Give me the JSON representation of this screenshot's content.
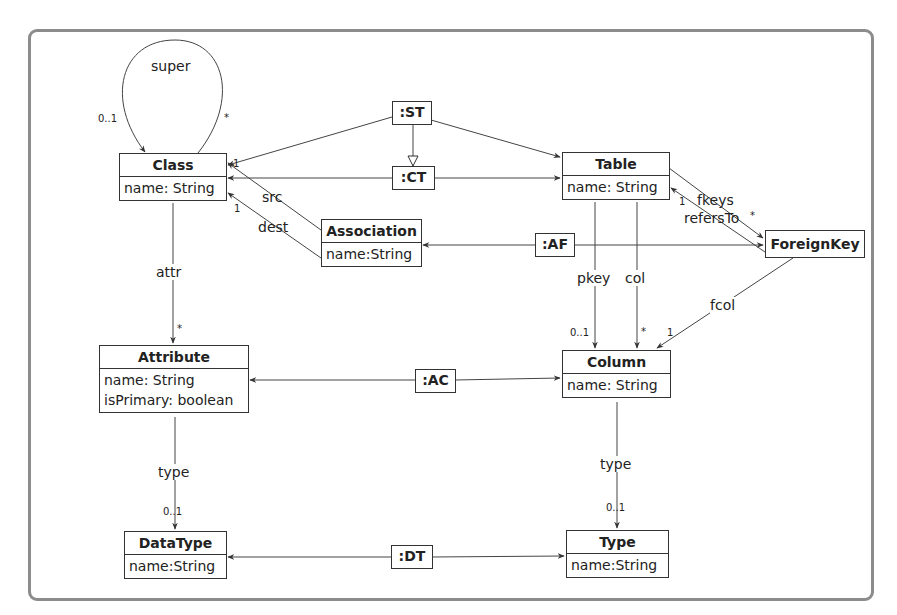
{
  "classes": {
    "class": {
      "name": "Class",
      "attributes": [
        "name: String"
      ]
    },
    "table": {
      "name": "Table",
      "attributes": [
        "name: String"
      ]
    },
    "association": {
      "name": "Association",
      "attributes": [
        "name:String"
      ]
    },
    "foreignkey": {
      "name": "ForeignKey",
      "attributes": []
    },
    "attribute": {
      "name": "Attribute",
      "attributes": [
        "name: String",
        "isPrimary: boolean"
      ]
    },
    "column": {
      "name": "Column",
      "attributes": [
        "name: String"
      ]
    },
    "datatype": {
      "name": "DataType",
      "attributes": [
        "name:String"
      ]
    },
    "type": {
      "name": "Type",
      "attributes": [
        "name:String"
      ]
    }
  },
  "mapping_nodes": {
    "st": ":ST",
    "ct": ":CT",
    "af": ":AF",
    "ac": ":AC",
    "dt": ":DT"
  },
  "edge_labels": {
    "super": "super",
    "super_mult_src": "0..1",
    "super_mult_tgt": "*",
    "src": "src",
    "src_mult": "1",
    "dest": "dest",
    "dest_mult": "1",
    "attr": "attr",
    "attr_mult": "*",
    "attr_type": "type",
    "attr_type_mult": "0..1",
    "fkeys": "fkeys",
    "fkeys_mult": "*",
    "refersTo": "refersTo",
    "refersTo_mult": "1",
    "pkey": "pkey",
    "pkey_mult": "0..1",
    "col": "col",
    "col_mult": "*",
    "fcol": "fcol",
    "fcol_mult": "1",
    "col_type": "type",
    "col_type_mult": "0..1"
  }
}
